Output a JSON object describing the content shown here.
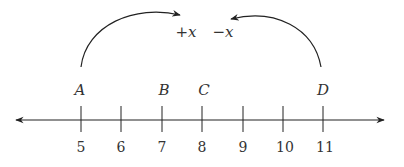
{
  "number_line": {
    "ticks": [
      "5",
      "6",
      "7",
      "8",
      "9",
      "10",
      "11"
    ],
    "points": [
      {
        "label": "A",
        "value": 5
      },
      {
        "label": "B",
        "value": 7
      },
      {
        "label": "C",
        "value": 8
      },
      {
        "label": "D",
        "value": 11
      }
    ]
  },
  "arrows": {
    "left_label": "+x",
    "right_label": "−x"
  },
  "colors": {
    "stroke": "#222222",
    "text": "#333333"
  }
}
